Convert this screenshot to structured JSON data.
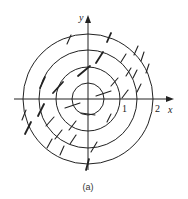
{
  "figure": {
    "caption": "(a)",
    "axes": {
      "x_label": "x",
      "y_label": "y"
    },
    "tick_labels": [
      {
        "text": "1",
        "value": 1
      },
      {
        "text": "2",
        "value": 2
      }
    ],
    "level_curves": {
      "type": "concentric circles",
      "radii": [
        0.5,
        1.0,
        1.5,
        2.0
      ]
    },
    "direction_marks": {
      "description": "short slanted segments on the circles, arranged in diagonal bands"
    },
    "colors": {
      "stroke": "#222222",
      "background": "#ffffff"
    }
  }
}
